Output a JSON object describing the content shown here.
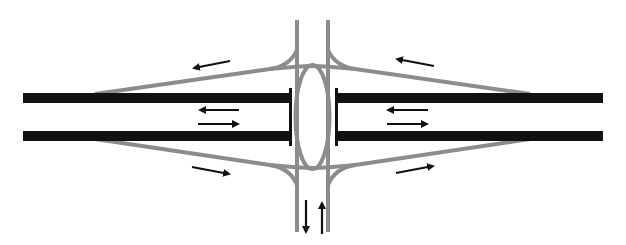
{
  "diagram": {
    "colors": {
      "background": "#ffffff",
      "freeway": "#111111",
      "ramp": "#8c8c8c",
      "arrow": "#111111"
    },
    "elements": {
      "freeway_west": "Freeway segment (west)",
      "freeway_east": "Freeway segment (east)",
      "arterial": "Two-line cross street",
      "roundabout": "Elongated ellipse crossing",
      "ramps": [
        "NW off-ramp",
        "SW on-ramp",
        "NE on-ramp",
        "SE off-ramp"
      ]
    },
    "arrows": [
      {
        "name": "nw-ramp-arrow",
        "direction": "west-up"
      },
      {
        "name": "ne-ramp-arrow",
        "direction": "west-down"
      },
      {
        "name": "west-fwy-arrow-1",
        "direction": "west"
      },
      {
        "name": "west-fwy-arrow-2",
        "direction": "east"
      },
      {
        "name": "east-fwy-arrow-1",
        "direction": "west"
      },
      {
        "name": "east-fwy-arrow-2",
        "direction": "east"
      },
      {
        "name": "sw-ramp-arrow",
        "direction": "east-down"
      },
      {
        "name": "se-ramp-arrow",
        "direction": "east-up"
      },
      {
        "name": "arterial-arrow-down",
        "direction": "south"
      },
      {
        "name": "arterial-arrow-up",
        "direction": "north"
      }
    ]
  }
}
